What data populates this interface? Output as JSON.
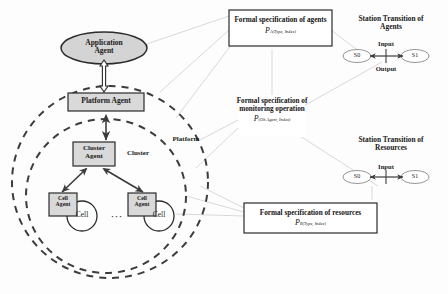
{
  "diagram": {
    "nodes": {
      "application_agent": "Application\nAgent",
      "application_agent_line1": "Application",
      "application_agent_line2": "Agent",
      "platform_agent": "Platform Agent",
      "cluster_agent_line1": "Cluster",
      "cluster_agent_line2": "Agent",
      "cell_agent_line1": "Cell",
      "cell_agent_line2": "Agent",
      "cell_label": "Cell",
      "ellipsis": "···"
    },
    "regions": {
      "platform": "Platform",
      "cluster": "Cluster"
    },
    "spec_boxes": [
      {
        "id": "agents",
        "line1": "Formal specification of agents",
        "line2": "",
        "symbol": "P",
        "subscript": "A(Type, Index)"
      },
      {
        "id": "monitoring",
        "line1": "Formal specification of",
        "line2": "monitoring operation",
        "symbol": "P",
        "subscript": "(Ob.Agent, Index)"
      },
      {
        "id": "resources",
        "line1": "Formal specification of resources",
        "line2": "",
        "symbol": "P",
        "subscript": "R(Type, Index)"
      }
    ],
    "transitions": [
      {
        "id": "agents",
        "title_line1": "Station Transition of",
        "title_line2": "Agents",
        "from_state": "S0",
        "to_state": "S1",
        "above_label": "Input",
        "below_label": "Output"
      },
      {
        "id": "resources",
        "title_line1": "Station Transition of",
        "title_line2": "Resources",
        "from_state": "S0",
        "to_state": "S1",
        "above_label": "Input",
        "below_label": ""
      }
    ],
    "colors": {
      "stroke": "#3c3c3c",
      "box_fill": "#d9d9d9",
      "ellipse_fill": "#d4d4d4",
      "cell_fill": "#ffffff",
      "faint_line": "#c8c8c8",
      "text": "#141414"
    }
  }
}
